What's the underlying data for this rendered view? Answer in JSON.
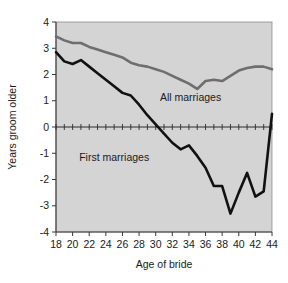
{
  "chart_data": {
    "type": "line",
    "title": "",
    "xlabel": "Age of bride",
    "ylabel": "Years groom older",
    "xlim": [
      18,
      44
    ],
    "ylim": [
      -4,
      4
    ],
    "xticks": [
      18,
      20,
      22,
      24,
      26,
      28,
      30,
      32,
      34,
      36,
      38,
      40,
      42,
      44
    ],
    "yticks": [
      4,
      3,
      2,
      1,
      0,
      -1,
      -2,
      -3,
      -4
    ],
    "xtick_labels": [
      "18",
      "20",
      "22",
      "24",
      "26",
      "28",
      "30",
      "32",
      "34",
      "36",
      "38",
      "40",
      "42",
      "44"
    ],
    "ytick_labels": [
      "4",
      "3",
      "2",
      "1",
      "0",
      "-1",
      "-2",
      "-3",
      "-4"
    ],
    "grid": false,
    "plot_background": "#d4d4d4",
    "minor_xticks_step": 1,
    "zero_line": 0,
    "legend_position": "inline-annotation",
    "x": [
      18,
      19,
      20,
      21,
      22,
      23,
      24,
      25,
      26,
      27,
      28,
      29,
      30,
      31,
      32,
      33,
      34,
      35,
      36,
      37,
      38,
      39,
      40,
      41,
      42,
      43,
      44
    ],
    "series": [
      {
        "name": "All marriages",
        "color": "#6e6e6e",
        "label_x": 34.2,
        "label_y": 1.0,
        "values": [
          3.45,
          3.3,
          3.2,
          3.2,
          3.05,
          2.95,
          2.85,
          2.75,
          2.65,
          2.45,
          2.35,
          2.3,
          2.2,
          2.1,
          1.95,
          1.8,
          1.65,
          1.45,
          1.75,
          1.8,
          1.75,
          1.95,
          2.15,
          2.25,
          2.3,
          2.3,
          2.2
        ]
      },
      {
        "name": "First marriages",
        "color": "#111111",
        "label_x": 25.0,
        "label_y": -1.3,
        "values": [
          2.85,
          2.5,
          2.4,
          2.55,
          2.3,
          2.05,
          1.8,
          1.55,
          1.3,
          1.2,
          0.85,
          0.45,
          0.1,
          -0.25,
          -0.6,
          -0.85,
          -0.7,
          -1.1,
          -1.55,
          -2.25,
          -2.25,
          -3.3,
          -2.5,
          -1.75,
          -2.65,
          -2.45,
          0.5
        ]
      }
    ],
    "annotations": [
      {
        "text": "All marriages",
        "x": 34.2,
        "y": 1.0
      },
      {
        "text": "First marriages",
        "x": 25.0,
        "y": -1.3
      }
    ]
  }
}
